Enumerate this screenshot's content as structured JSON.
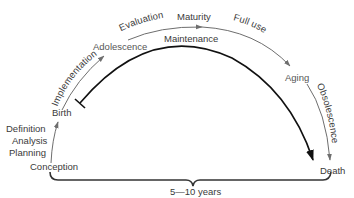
{
  "diagram": {
    "stages": {
      "pre_birth": [
        "Definition",
        "Analysis",
        "Planning"
      ],
      "conception": "Conception",
      "birth": "Birth",
      "implementation": "Implementation",
      "adolescence": "Adolescence",
      "evaluation": "Evaluation",
      "maturity": "Maturity",
      "full_use": "Full use",
      "aging": "Aging",
      "obsolescence": "Obsolescence",
      "death": "Death"
    },
    "maintenance": "Maintenance",
    "duration": "5—10 years",
    "colors": {
      "life_arc": "#6e6e6e",
      "maintenance_arc": "#111111",
      "text": "#3a3a3a"
    }
  }
}
